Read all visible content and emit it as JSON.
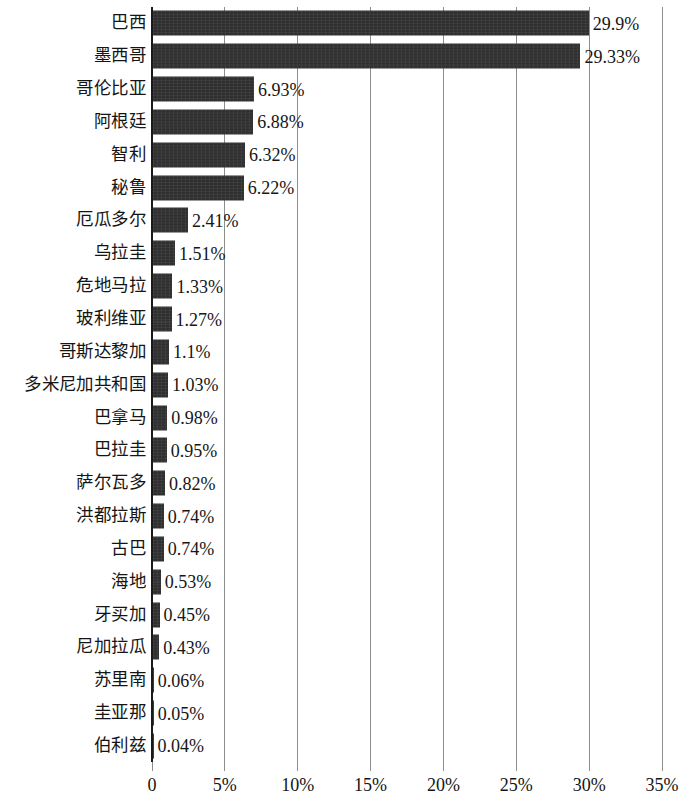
{
  "chart_data": {
    "type": "bar",
    "orientation": "horizontal",
    "title": "",
    "subtitle": "",
    "xlabel": "",
    "ylabel": "",
    "xlim": [
      0,
      35
    ],
    "xtick_labels": [
      "0",
      "5%",
      "10%",
      "15%",
      "20%",
      "25%",
      "30%",
      "35%"
    ],
    "xticks": [
      0,
      5,
      10,
      15,
      20,
      25,
      30,
      35
    ],
    "grid": "vertical",
    "legend": "none",
    "bar_color": "#2f2f2f",
    "axis_color": "#8d8d8d",
    "categories": [
      "巴西",
      "墨西哥",
      "哥伦比亚",
      "阿根廷",
      "智利",
      "秘鲁",
      "厄瓜多尔",
      "乌拉圭",
      "危地马拉",
      "玻利维亚",
      "哥斯达黎加",
      "多米尼加共和国",
      "巴拿马",
      "巴拉圭",
      "萨尔瓦多",
      "洪都拉斯",
      "古巴",
      "海地",
      "牙买加",
      "尼加拉瓜",
      "苏里南",
      "圭亚那",
      "伯利兹"
    ],
    "values": [
      29.9,
      29.33,
      6.93,
      6.88,
      6.32,
      6.22,
      2.41,
      1.51,
      1.33,
      1.27,
      1.1,
      1.03,
      0.98,
      0.95,
      0.82,
      0.74,
      0.74,
      0.53,
      0.45,
      0.43,
      0.06,
      0.05,
      0.04
    ],
    "value_labels": [
      "29.9%",
      "29.33%",
      "6.93%",
      "6.88%",
      "6.32%",
      "6.22%",
      "2.41%",
      "1.51%",
      "1.33%",
      "1.27%",
      "1.1%",
      "1.03%",
      "0.98%",
      "0.95%",
      "0.82%",
      "0.74%",
      "0.74%",
      "0.53%",
      "0.45%",
      "0.43%",
      "0.06%",
      "0.05%",
      "0.04%"
    ]
  }
}
